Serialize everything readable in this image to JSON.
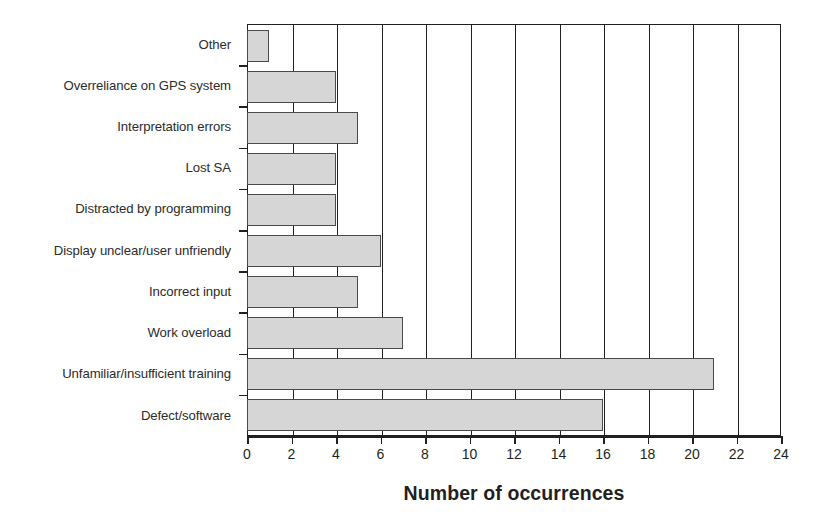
{
  "chart_data": {
    "type": "bar",
    "orientation": "horizontal",
    "title": "",
    "xlabel": "Number of occurrences",
    "ylabel": "",
    "xlim": [
      0,
      24
    ],
    "xticks": [
      0,
      2,
      4,
      6,
      8,
      10,
      12,
      14,
      16,
      18,
      20,
      22,
      24
    ],
    "grid": true,
    "legend": false,
    "categories": [
      "Other",
      "Overreliance on GPS system",
      "Interpretation errors",
      "Lost SA",
      "Distracted by programming",
      "Display unclear/user unfriendly",
      "Incorrect input",
      "Work overload",
      "Unfamiliar/insufficient training",
      "Defect/software"
    ],
    "values": [
      1,
      4,
      5,
      4,
      4,
      6,
      5,
      7,
      21,
      16
    ],
    "bar_fill_color": "#d6d6d6",
    "bar_edge_color": "#4a4a4a",
    "axis_color": "#231f20"
  }
}
